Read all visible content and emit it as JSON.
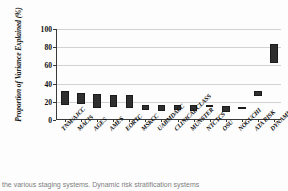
{
  "chart_data": {
    "type": "bar",
    "title": "",
    "xlabel": "",
    "ylabel": "Proportion of  Variance Explained (%)",
    "ylim": [
      0,
      100
    ],
    "yticks": [
      0,
      20,
      40,
      60,
      80,
      100
    ],
    "ytick_labels": [
      "0",
      "20",
      "40",
      "60",
      "80",
      "100"
    ],
    "grid": true,
    "legend": "none",
    "bar_style": "floating-range",
    "categories": [
      "TNM/AJCC",
      "MACIS",
      "AGES",
      "AMES",
      "EORTC",
      "MSKCC",
      "UABMDACC",
      "CLINICAL CLASS",
      "MUNSTER",
      "NTCTCS",
      "OSU",
      "NOGUCHI",
      "ATA RISK",
      "DYNAMIC RISK"
    ],
    "ranges": [
      {
        "category": "TNM/AJCC",
        "low": 17,
        "high": 32
      },
      {
        "category": "MACIS",
        "low": 18,
        "high": 30
      },
      {
        "category": "AGES",
        "low": 13,
        "high": 29
      },
      {
        "category": "AMES",
        "low": 14,
        "high": 28
      },
      {
        "category": "EORTC",
        "low": 13,
        "high": 28
      },
      {
        "category": "MSKCC",
        "low": 11,
        "high": 17
      },
      {
        "category": "UABMDACC",
        "low": 10,
        "high": 17
      },
      {
        "category": "CLINICAL CLASS",
        "low": 11,
        "high": 17
      },
      {
        "category": "MUNSTER",
        "low": 10,
        "high": 16
      },
      {
        "category": "NTCTCS",
        "low": 14,
        "high": 17
      },
      {
        "category": "OSU",
        "low": 9,
        "high": 15
      },
      {
        "category": "NOGUCHI",
        "low": 12,
        "high": 14
      },
      {
        "category": "ATA RISK",
        "low": 26,
        "high": 32
      },
      {
        "category": "DYNAMIC RISK",
        "low": 63,
        "high": 83
      }
    ],
    "colors": {
      "bar_fill": "#2f2f2f",
      "bar_edge": "#1b1b1b",
      "axis": "#3a3a3a",
      "grid": "#d2d2d2",
      "background": "#fdfdfd",
      "text": "#101010"
    }
  },
  "caption": {
    "text": "the various staging systems. Dynamic risk stratification systems"
  }
}
